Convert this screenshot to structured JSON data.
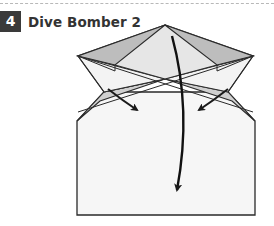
{
  "step": {
    "number": "4",
    "title": "Dive Bomber 2"
  },
  "diagram": {
    "colors": {
      "paper": "#f6f6f6",
      "shaded_fold": "#c8c8c8",
      "outline": "#2a2a2a",
      "badge": "#3a3a3a"
    },
    "icons": [
      "fold-arrow-left",
      "fold-arrow-right",
      "fold-arrow-down-curved"
    ]
  }
}
